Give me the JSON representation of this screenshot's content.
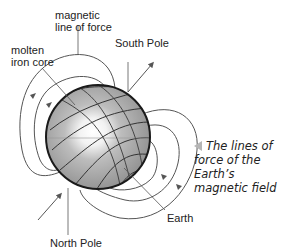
{
  "diagram": {
    "labels": {
      "magnetic_line_of_force": "magnetic\nline of force",
      "molten_iron_core": "molten\niron core",
      "south_pole": "South Pole",
      "north_pole": "North Pole",
      "earth": "Earth"
    },
    "caption": "The lines of force of the Earth's magnetic field",
    "caption_lines": [
      "The lines of",
      "force of the Earth’s",
      "magnetic field"
    ],
    "colors": {
      "sphere_fill": "#9a9a9a",
      "sphere_outline": "#1a1a1a",
      "core_glow": "#ffffff",
      "field_lines": "#555555",
      "caption_marker": "#b5b5b5"
    },
    "icons": [
      "caption-pointer-triangle-icon",
      "field-direction-arrow-icon"
    ]
  }
}
